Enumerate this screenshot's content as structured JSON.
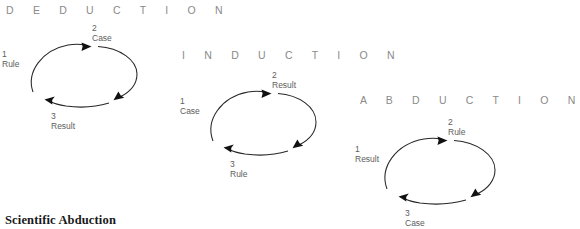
{
  "figure": {
    "caption": "Scientific Abduction",
    "background_color": "#ffffff",
    "stroke_color": "#272727",
    "title_color": "#8a8a8a",
    "label_color": "#5d5d5d"
  },
  "diagrams": [
    {
      "id": "deduction",
      "title": "D E D U C T I O N",
      "title_plain": "DEDUCTION",
      "nodes": [
        {
          "number": "1",
          "label": "Rule",
          "position": "left"
        },
        {
          "number": "2",
          "label": "Case",
          "position": "top"
        },
        {
          "number": "3",
          "label": "Result",
          "position": "bottom"
        }
      ]
    },
    {
      "id": "induction",
      "title": "I N D U C T I O N",
      "title_plain": "INDUCTION",
      "nodes": [
        {
          "number": "1",
          "label": "Case",
          "position": "left"
        },
        {
          "number": "2",
          "label": "Result",
          "position": "top"
        },
        {
          "number": "3",
          "label": "Rule",
          "position": "bottom"
        }
      ]
    },
    {
      "id": "abduction",
      "title": "A B D U C T I O N",
      "title_plain": "ABDUCTION",
      "nodes": [
        {
          "number": "1",
          "label": "Result",
          "position": "left"
        },
        {
          "number": "2",
          "label": "Rule",
          "position": "top"
        },
        {
          "number": "3",
          "label": "Case",
          "position": "bottom"
        }
      ]
    }
  ]
}
